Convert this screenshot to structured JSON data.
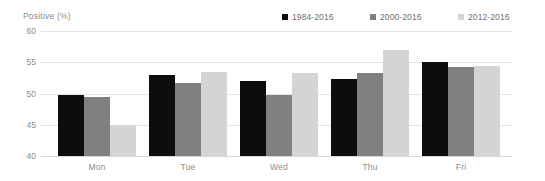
{
  "chart_data": {
    "type": "bar",
    "title": "",
    "xlabel": "",
    "ylabel": "Positive (%)",
    "ylim": [
      40,
      60
    ],
    "yticks": [
      40,
      45,
      50,
      55,
      60
    ],
    "grid": true,
    "legend_position": "top-right",
    "categories": [
      "Mon",
      "Tue",
      "Wed",
      "Thu",
      "Fri"
    ],
    "series": [
      {
        "name": "1984-2016",
        "color": "#0d0d0d",
        "values": [
          49.8,
          53.0,
          52.0,
          52.3,
          55.0
        ]
      },
      {
        "name": "2000-2016",
        "color": "#808080",
        "values": [
          49.4,
          51.7,
          49.7,
          53.3,
          54.2
        ]
      },
      {
        "name": "2012-2016",
        "color": "#d4d4d4",
        "values": [
          45.0,
          53.5,
          53.3,
          57.0,
          54.4
        ]
      }
    ]
  }
}
